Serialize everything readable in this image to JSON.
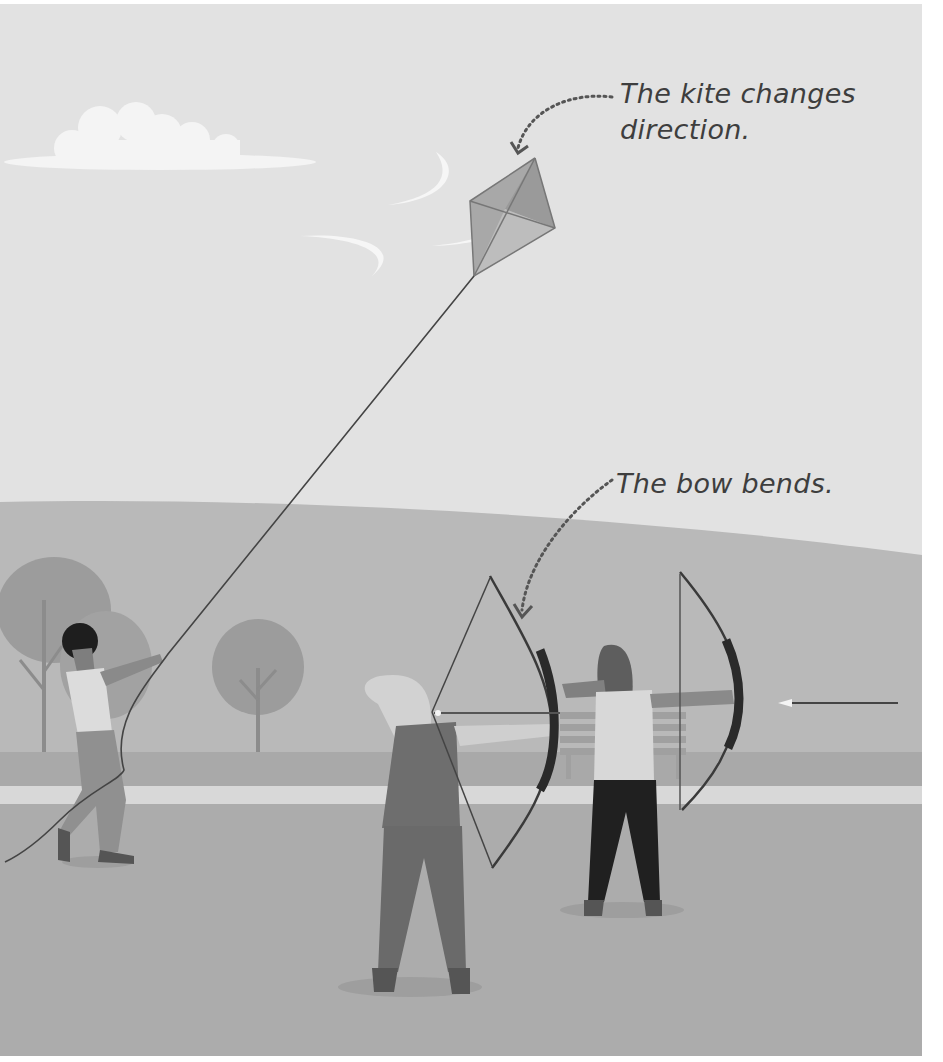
{
  "illustration": {
    "subject": "Park scene: a person flying a kite and two archers drawing bows",
    "captions": {
      "kite_line1": "The kite changes",
      "kite_line2": "direction.",
      "bow": "The bow bends."
    },
    "colors": {
      "sky": "#e2e2e2",
      "hill": "#b9b9b9",
      "grass_band": "#a9a9a9",
      "path": "#d8d8d8",
      "ground": "#acacac",
      "tree": "#9a9a9a",
      "trunk": "#8c8c8c",
      "bench": "#9d9d9d",
      "text": "#3e3e3e",
      "line": "#444444"
    }
  }
}
